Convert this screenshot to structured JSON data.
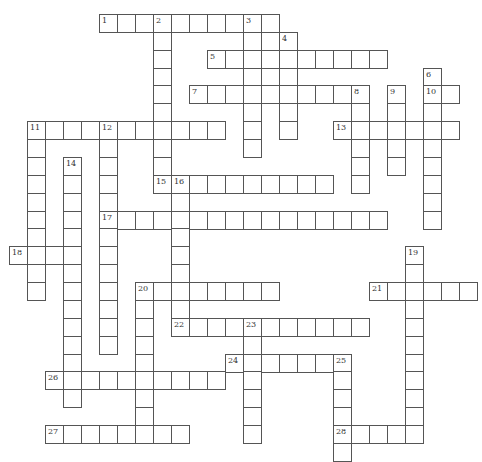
{
  "puzzle": {
    "type": "crossword",
    "cell_size_px": {
      "w": 18,
      "h": 17.87
    },
    "origin_px": {
      "x": 9,
      "y": 14
    },
    "colors": {
      "border": "#555555",
      "cell_bg": "#ffffff",
      "number": "#333333"
    },
    "entries": [
      {
        "number": 1,
        "dir": "across",
        "col": 5,
        "row": 0,
        "length": 10
      },
      {
        "number": 2,
        "dir": "down",
        "col": 8,
        "row": 0,
        "length": 10
      },
      {
        "number": 3,
        "dir": "down",
        "col": 13,
        "row": 0,
        "length": 8
      },
      {
        "number": 4,
        "dir": "down",
        "col": 15,
        "row": 1,
        "length": 6
      },
      {
        "number": 5,
        "dir": "across",
        "col": 11,
        "row": 2,
        "length": 10
      },
      {
        "number": 6,
        "dir": "down",
        "col": 23,
        "row": 3,
        "length": 9
      },
      {
        "number": 7,
        "dir": "across",
        "col": 10,
        "row": 4,
        "length": 10
      },
      {
        "number": 8,
        "dir": "down",
        "col": 19,
        "row": 4,
        "length": 6
      },
      {
        "number": 9,
        "dir": "down",
        "col": 21,
        "row": 4,
        "length": 5
      },
      {
        "number": 10,
        "dir": "across",
        "col": 23,
        "row": 4,
        "length": 2
      },
      {
        "number": 11,
        "dir": "across",
        "col": 1,
        "row": 6,
        "length": 11
      },
      {
        "number": 11,
        "dir": "down",
        "col": 1,
        "row": 6,
        "length": 10
      },
      {
        "number": 12,
        "dir": "down",
        "col": 5,
        "row": 6,
        "length": 13
      },
      {
        "number": 13,
        "dir": "across",
        "col": 18,
        "row": 6,
        "length": 7
      },
      {
        "number": 14,
        "dir": "down",
        "col": 3,
        "row": 8,
        "length": 14
      },
      {
        "number": 15,
        "dir": "across",
        "col": 8,
        "row": 9,
        "length": 10
      },
      {
        "number": 16,
        "dir": "down",
        "col": 9,
        "row": 9,
        "length": 9
      },
      {
        "number": 17,
        "dir": "across",
        "col": 5,
        "row": 11,
        "length": 16
      },
      {
        "number": 18,
        "dir": "across",
        "col": 0,
        "row": 13,
        "length": 4
      },
      {
        "number": 19,
        "dir": "down",
        "col": 22,
        "row": 13,
        "length": 11
      },
      {
        "number": 20,
        "dir": "across",
        "col": 7,
        "row": 15,
        "length": 8
      },
      {
        "number": 20,
        "dir": "down",
        "col": 7,
        "row": 15,
        "length": 9
      },
      {
        "number": 21,
        "dir": "across",
        "col": 20,
        "row": 15,
        "length": 6
      },
      {
        "number": 22,
        "dir": "across",
        "col": 9,
        "row": 17,
        "length": 11
      },
      {
        "number": 23,
        "dir": "down",
        "col": 13,
        "row": 17,
        "length": 7
      },
      {
        "number": 24,
        "dir": "across",
        "col": 12,
        "row": 19,
        "length": 7
      },
      {
        "number": 25,
        "dir": "down",
        "col": 18,
        "row": 19,
        "length": 6
      },
      {
        "number": 26,
        "dir": "across",
        "col": 2,
        "row": 20,
        "length": 10
      },
      {
        "number": 27,
        "dir": "across",
        "col": 2,
        "row": 23,
        "length": 8
      },
      {
        "number": 28,
        "dir": "across",
        "col": 18,
        "row": 23,
        "length": 5
      }
    ]
  }
}
